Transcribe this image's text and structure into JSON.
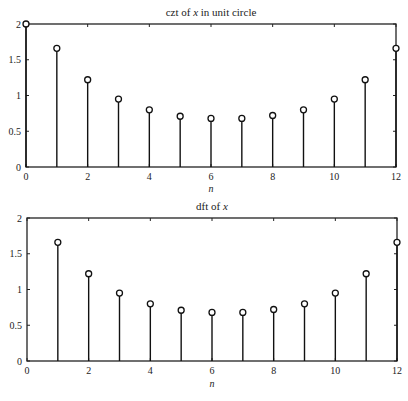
{
  "chart_data": [
    {
      "type": "stem",
      "title": "czt of x in unit circle",
      "title_parts": {
        "pre": "czt of ",
        "var": "x",
        "post": " in unit circle"
      },
      "xlabel": "n",
      "ylabel": "",
      "xlim": [
        0,
        12
      ],
      "ylim": [
        0,
        2
      ],
      "xticks": [
        0,
        2,
        4,
        6,
        8,
        10,
        12
      ],
      "yticks": [
        0,
        0.5,
        1,
        1.5,
        2
      ],
      "ytick_labels": [
        "0",
        "0.5",
        "1",
        "1.5",
        "2"
      ],
      "grid": false,
      "x": [
        0,
        1,
        2,
        3,
        4,
        5,
        6,
        7,
        8,
        9,
        10,
        11,
        12
      ],
      "values": [
        2.0,
        1.66,
        1.22,
        0.95,
        0.8,
        0.71,
        0.68,
        0.68,
        0.72,
        0.8,
        0.95,
        1.22,
        1.66
      ]
    },
    {
      "type": "stem",
      "title": "dft of x",
      "title_parts": {
        "pre": "dft of ",
        "var": "x",
        "post": ""
      },
      "xlabel": "n",
      "ylabel": "",
      "xlim": [
        0,
        12
      ],
      "ylim": [
        0,
        2
      ],
      "xticks": [
        0,
        2,
        4,
        6,
        8,
        10,
        12
      ],
      "yticks": [
        0,
        0.5,
        1,
        1.5,
        2
      ],
      "ytick_labels": [
        "0",
        "0.5",
        "1",
        "1.5",
        "2"
      ],
      "grid": false,
      "x": [
        1,
        2,
        3,
        4,
        5,
        6,
        7,
        8,
        9,
        10,
        11,
        12
      ],
      "values": [
        1.66,
        1.22,
        0.95,
        0.8,
        0.71,
        0.68,
        0.68,
        0.72,
        0.8,
        0.95,
        1.22,
        1.66
      ]
    }
  ]
}
